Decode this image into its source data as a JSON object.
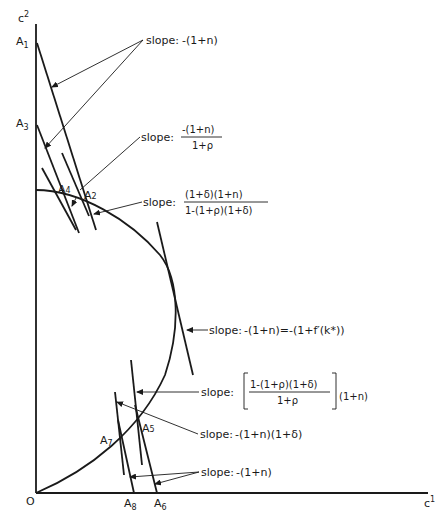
{
  "axes": {
    "y_label": "c",
    "y_label_sup": "2",
    "x_label": "c",
    "x_label_sup": "1",
    "origin_label": "O"
  },
  "points": {
    "A1": {
      "base": "A",
      "sub": "1"
    },
    "A2": {
      "base": "A",
      "sub": "2"
    },
    "A3": {
      "base": "A",
      "sub": "3"
    },
    "A4": {
      "base": "A",
      "sub": "4"
    },
    "A5": {
      "base": "A",
      "sub": "5"
    },
    "A6": {
      "base": "A",
      "sub": "6"
    },
    "A7": {
      "base": "A",
      "sub": "7"
    },
    "A8": {
      "base": "A",
      "sub": "8"
    }
  },
  "annotations": {
    "slope1": {
      "prefix": "slope:",
      "text": "-(1+n)"
    },
    "slope2": {
      "prefix": "slope:",
      "numerator": "-(1+n)",
      "denominator": "1+ρ"
    },
    "slope3": {
      "prefix": "slope:",
      "numerator": "(1+δ)(1+n)",
      "denominator": "1-(1+ρ)(1+δ)"
    },
    "slope4": {
      "prefix": "slope:",
      "text": "-(1+n)=-(1+f′(k*))"
    },
    "slope5": {
      "prefix": "slope:",
      "numerator": "1-(1+ρ)(1+δ)",
      "denominator": "1+ρ",
      "suffix": "(1+n)"
    },
    "slope6": {
      "prefix": "slope:",
      "text": "-(1+n)(1+δ)"
    },
    "slope7": {
      "prefix": "slope:",
      "text": "-(1+n)"
    }
  }
}
